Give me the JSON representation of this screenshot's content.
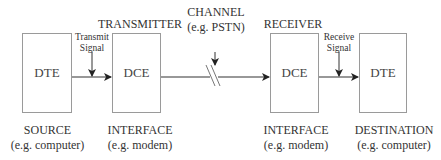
{
  "diagram": {
    "stages": [
      {
        "box": "DTE",
        "header": "",
        "footer_title": "SOURCE",
        "footer_sub": "(e.g. computer)"
      },
      {
        "box": "DCE",
        "header": "TRANSMITTER",
        "footer_title": "INTERFACE",
        "footer_sub": "(e.g. modem)"
      },
      {
        "box": "DCE",
        "header": "RECEIVER",
        "footer_title": "INTERFACE",
        "footer_sub": "(e.g. modem)"
      },
      {
        "box": "DTE",
        "header": "",
        "footer_title": "DESTINATION",
        "footer_sub": "(e.g. computer)"
      }
    ],
    "channel": {
      "title": "CHANNEL",
      "sub": "(e.g. PSTN)"
    },
    "transmit_signal": {
      "line1": "Transmit",
      "line2": "Signal"
    },
    "receive_signal": {
      "line1": "Receive",
      "line2": "Signal"
    }
  }
}
